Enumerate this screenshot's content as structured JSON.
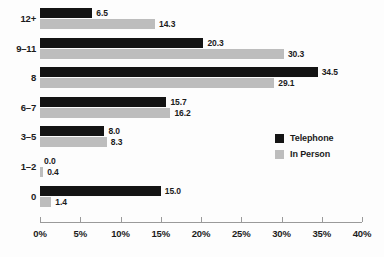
{
  "chart_data": {
    "type": "bar",
    "orientation": "horizontal",
    "title": "",
    "xlabel": "",
    "ylabel": "",
    "categories": [
      "12+",
      "9–11",
      "8",
      "6–7",
      "3–5",
      "1–2",
      "0"
    ],
    "series": [
      {
        "name": "Telephone",
        "color": "#141414",
        "values": [
          6.5,
          20.3,
          34.5,
          15.7,
          8.0,
          0.0,
          15.0
        ]
      },
      {
        "name": "In Person",
        "color": "#bdbdbd",
        "values": [
          14.3,
          30.3,
          29.1,
          16.2,
          8.3,
          0.4,
          1.4
        ]
      }
    ],
    "value_labels": [
      [
        "6.5",
        "14.3"
      ],
      [
        "20.3",
        "30.3"
      ],
      [
        "34.5",
        "29.1"
      ],
      [
        "15.7",
        "16.2"
      ],
      [
        "8.0",
        "8.3"
      ],
      [
        "0.0",
        "0.4"
      ],
      [
        "15.0",
        "1.4"
      ]
    ],
    "xlim": [
      0,
      40
    ],
    "xticks": [
      0,
      5,
      10,
      15,
      20,
      25,
      30,
      35,
      40
    ],
    "xtick_labels": [
      "0%",
      "5%",
      "10%",
      "15%",
      "20%",
      "25%",
      "30%",
      "35%",
      "40%"
    ],
    "grid": false,
    "legend_position": "middle-right"
  },
  "legend": {
    "entries": [
      {
        "label": "Telephone",
        "color": "#141414"
      },
      {
        "label": "In Person",
        "color": "#bdbdbd"
      }
    ]
  }
}
